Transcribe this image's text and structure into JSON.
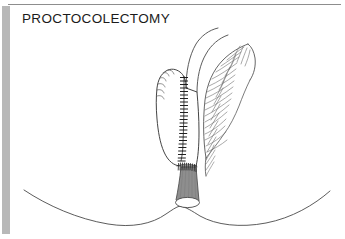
{
  "figure": {
    "title": "PROCTOCOLECTOMY",
    "kind": "medical-line-illustration",
    "background_color": "#ffffff",
    "ink_color": "#3a3a3a",
    "title_color": "#1b1b1b"
  },
  "frame": {
    "top_rule": {
      "color": "#8d8d8d",
      "x1": 8,
      "y1": 4,
      "x2": 341,
      "y2": 4,
      "thickness": 1
    },
    "left_bar": {
      "color": "#b8b8b8",
      "x": 2,
      "y": 6,
      "width": 8,
      "height": 228
    }
  },
  "parts": [
    {
      "name": "perineum-buttock-contour",
      "label": "Perineal / buttock contour",
      "stroke": "#4a4a4a",
      "description": "wide double-lobed curve across lower figure"
    },
    {
      "name": "ileal-pouch-body",
      "label": "Ileal pouch",
      "stroke": "#3a3a3a",
      "fill": "#ffffff"
    },
    {
      "name": "pouch-staple-line",
      "label": "Pouch staple line",
      "stroke": "#111111",
      "staple_count": 26
    },
    {
      "name": "afferent-limb",
      "label": "Afferent ileal limb",
      "stroke": "#4a4a4a"
    },
    {
      "name": "mesentery",
      "label": "Mesentery with vascular arcade",
      "stroke": "#5a5a5a",
      "vessel_count": 22
    },
    {
      "name": "rectal-muscular-cuff",
      "label": "Rectal muscular cuff / anal canal",
      "fill": "#8e8e8e",
      "stroke": "#4a4a4a"
    },
    {
      "name": "pouch-anal-anastomosis",
      "label": "Pouch-anal anastomosis suture line",
      "stroke": "#222222",
      "suture_count": 19
    },
    {
      "name": "anal-orifice",
      "label": "Anal orifice",
      "fill": "#ffffff",
      "stroke": "#4a4a4a"
    }
  ]
}
